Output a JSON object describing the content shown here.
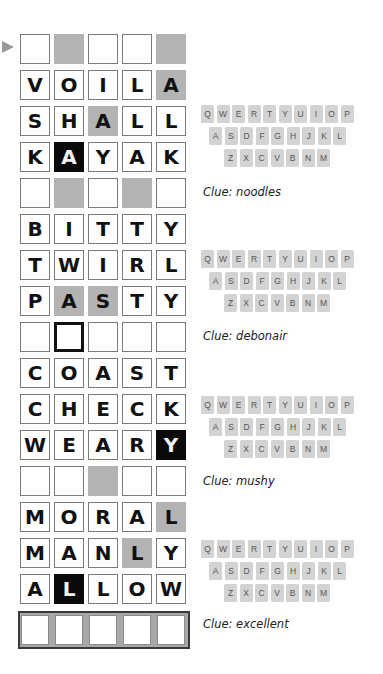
{
  "game": {
    "rows": [
      {
        "letters": [
          "",
          "",
          "",
          "",
          ""
        ],
        "fills": [
          "e",
          "g",
          "e",
          "e",
          "g"
        ]
      },
      {
        "letters": [
          "V",
          "O",
          "I",
          "L",
          "A"
        ],
        "fills": [
          "e",
          "e",
          "e",
          "e",
          "g"
        ]
      },
      {
        "letters": [
          "S",
          "H",
          "A",
          "L",
          "L"
        ],
        "fills": [
          "e",
          "e",
          "g",
          "e",
          "e"
        ]
      },
      {
        "letters": [
          "K",
          "A",
          "Y",
          "A",
          "K"
        ],
        "fills": [
          "e",
          "b",
          "e",
          "e",
          "e"
        ]
      },
      {
        "letters": [
          "",
          "",
          "",
          "",
          ""
        ],
        "fills": [
          "e",
          "g",
          "e",
          "g",
          "e"
        ]
      },
      {
        "letters": [
          "B",
          "I",
          "T",
          "T",
          "Y"
        ],
        "fills": [
          "e",
          "e",
          "e",
          "e",
          "e"
        ]
      },
      {
        "letters": [
          "T",
          "W",
          "I",
          "R",
          "L"
        ],
        "fills": [
          "e",
          "e",
          "e",
          "e",
          "e"
        ]
      },
      {
        "letters": [
          "P",
          "A",
          "S",
          "T",
          "Y"
        ],
        "fills": [
          "e",
          "g",
          "g",
          "e",
          "e"
        ]
      },
      {
        "letters": [
          "",
          "",
          "",
          "",
          ""
        ],
        "fills": [
          "e",
          "sel",
          "e",
          "e",
          "e"
        ]
      },
      {
        "letters": [
          "C",
          "O",
          "A",
          "S",
          "T"
        ],
        "fills": [
          "e",
          "e",
          "e",
          "e",
          "e"
        ]
      },
      {
        "letters": [
          "C",
          "H",
          "E",
          "C",
          "K"
        ],
        "fills": [
          "e",
          "e",
          "e",
          "e",
          "e"
        ]
      },
      {
        "letters": [
          "W",
          "E",
          "A",
          "R",
          "Y"
        ],
        "fills": [
          "e",
          "e",
          "e",
          "e",
          "b"
        ]
      },
      {
        "letters": [
          "",
          "",
          "",
          "",
          ""
        ],
        "fills": [
          "e",
          "e",
          "g",
          "e",
          "e"
        ]
      },
      {
        "letters": [
          "M",
          "O",
          "R",
          "A",
          "L"
        ],
        "fills": [
          "e",
          "e",
          "e",
          "e",
          "g"
        ]
      },
      {
        "letters": [
          "M",
          "A",
          "N",
          "L",
          "Y"
        ],
        "fills": [
          "e",
          "e",
          "e",
          "g",
          "e"
        ]
      },
      {
        "letters": [
          "A",
          "L",
          "L",
          "O",
          "W"
        ],
        "fills": [
          "e",
          "b",
          "e",
          "e",
          "e"
        ]
      }
    ],
    "final_row": [
      "",
      "",
      "",
      "",
      ""
    ],
    "row_indicator_icon": "arrow-right-icon",
    "colors": {
      "gray": "#b3b3b3",
      "black": "#0a0a0a",
      "key": "#d3d3d3"
    }
  },
  "keyboards": [
    {
      "rows": [
        [
          "Q",
          "W",
          "E",
          "R",
          "T",
          "Y",
          "U",
          "I",
          "O",
          "P"
        ],
        [
          "A",
          "S",
          "D",
          "F",
          "G",
          "H",
          "J",
          "K",
          "L"
        ],
        [
          "Z",
          "X",
          "C",
          "V",
          "B",
          "N",
          "M"
        ]
      ],
      "clue": "Clue: noodles"
    },
    {
      "rows": [
        [
          "Q",
          "W",
          "E",
          "R",
          "T",
          "Y",
          "U",
          "I",
          "O",
          "P"
        ],
        [
          "A",
          "S",
          "D",
          "F",
          "G",
          "H",
          "J",
          "K",
          "L"
        ],
        [
          "Z",
          "X",
          "C",
          "V",
          "B",
          "N",
          "M"
        ]
      ],
      "clue": "Clue: debonair"
    },
    {
      "rows": [
        [
          "Q",
          "W",
          "E",
          "R",
          "T",
          "Y",
          "U",
          "I",
          "O",
          "P"
        ],
        [
          "A",
          "S",
          "D",
          "F",
          "G",
          "H",
          "J",
          "K",
          "L"
        ],
        [
          "Z",
          "X",
          "C",
          "V",
          "B",
          "N",
          "M"
        ]
      ],
      "clue": "Clue: mushy"
    },
    {
      "rows": [
        [
          "Q",
          "W",
          "E",
          "R",
          "T",
          "Y",
          "U",
          "I",
          "O",
          "P"
        ],
        [
          "A",
          "S",
          "D",
          "F",
          "G",
          "H",
          "J",
          "K",
          "L"
        ],
        [
          "Z",
          "X",
          "C",
          "V",
          "B",
          "N",
          "M"
        ]
      ],
      "clue": "Clue: excellent"
    }
  ]
}
